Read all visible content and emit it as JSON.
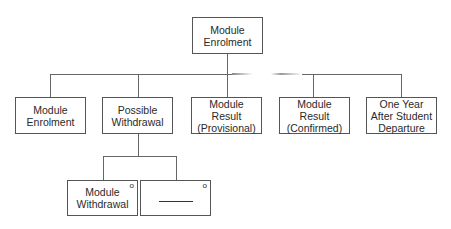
{
  "diagram": {
    "root": {
      "lines": [
        "Module",
        "Enrolment"
      ]
    },
    "children": [
      {
        "lines": [
          "Module",
          "Enrolment"
        ]
      },
      {
        "lines": [
          "Possible",
          "Withdrawal"
        ]
      },
      {
        "lines": [
          "Module",
          "Result",
          "(Provisional)"
        ]
      },
      {
        "lines": [
          "Module",
          "Result",
          "(Confirmed)"
        ]
      },
      {
        "lines": [
          "One Year",
          "After Student",
          "Departure"
        ]
      }
    ],
    "sub_children": [
      {
        "lines": [
          "Module",
          "Withdrawal"
        ],
        "marker": "o"
      },
      {
        "lines": [],
        "placeholder": "blank-line",
        "marker": "o"
      }
    ]
  }
}
